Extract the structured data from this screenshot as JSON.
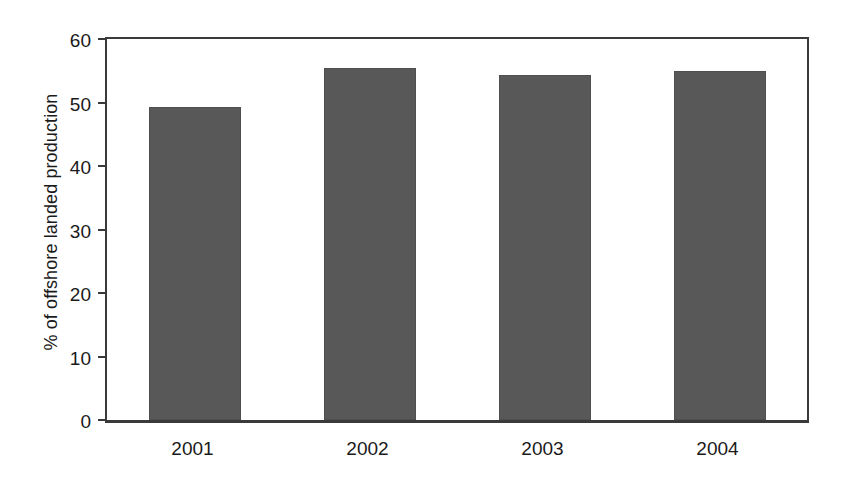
{
  "chart_data": {
    "type": "bar",
    "title": "",
    "subtitle": "",
    "xlabel": "",
    "ylabel": "% of offshore landed production",
    "categories": [
      "2001",
      "2002",
      "2003",
      "2004"
    ],
    "values": [
      49.3,
      55.5,
      54.4,
      55.0
    ],
    "series": [
      {
        "name": "% of offshore landed production",
        "values": [
          49.3,
          55.5,
          54.4,
          55.0
        ]
      }
    ],
    "ylim": [
      0,
      60
    ],
    "yticks": [
      0,
      10,
      20,
      30,
      40,
      50,
      60
    ],
    "ytick_labels": [
      "0",
      "10",
      "20",
      "30",
      "40",
      "50",
      "60"
    ],
    "grid": false,
    "legend": false,
    "legend_position": "none",
    "bar_color": "#585858",
    "axis_color": "#3a3a3a",
    "background_color": "#ffffff",
    "annotations": []
  },
  "axes": {
    "y_title": "% of offshore landed production"
  }
}
